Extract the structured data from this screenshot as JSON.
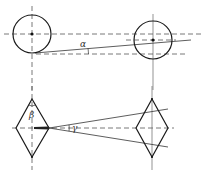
{
  "diagram": {
    "title": "",
    "colors": {
      "stroke": "#1a1a1a",
      "thin": "#444444",
      "dash": "#555555",
      "background": "#ffffff"
    },
    "labels": {
      "alpha": "α",
      "beta": "β",
      "gamma": "γ"
    },
    "top_view": {
      "left_circle": {
        "cx": 32,
        "cy": 34,
        "r": 19
      },
      "right_circle": {
        "cx": 153,
        "cy": 40,
        "r": 19
      }
    },
    "front_view": {
      "left_diamond": {
        "cx": 32,
        "cy": 128,
        "half_w": 17,
        "half_h": 29
      },
      "right_diamond": {
        "cx": 152,
        "cy": 128,
        "half_w": 16,
        "half_h": 29
      }
    }
  }
}
